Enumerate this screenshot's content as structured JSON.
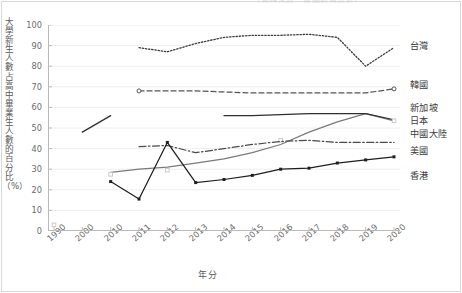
{
  "title_remnant": "（資料來源：各國教育統計）",
  "axes": {
    "ylabel": "大學新生人數占高中畢業生人數的百分比（%）",
    "xlabel": "年分",
    "yticks": [
      "100",
      "90",
      "80",
      "70",
      "60",
      "50",
      "40",
      "30",
      "20",
      "10",
      "0"
    ],
    "xticks": [
      "1990",
      "2000",
      "2010",
      "2011",
      "2012",
      "2013",
      "2014",
      "2015",
      "2016",
      "2017",
      "2018",
      "2019",
      "2020"
    ]
  },
  "legend": [
    {
      "label": "台灣",
      "key": "taiwan"
    },
    {
      "label": "韓國",
      "key": "korea"
    },
    {
      "label": "新加坡",
      "key": "singapore"
    },
    {
      "label": "日本",
      "key": "japan"
    },
    {
      "label": "中國大陸",
      "key": "china"
    },
    {
      "label": "美國",
      "key": "usa"
    },
    {
      "label": "香港",
      "key": "hongkong"
    }
  ],
  "chart_data": {
    "type": "line",
    "title": "",
    "xlabel": "年分",
    "ylabel": "大學新生人數占高中畢業生人數的百分比（%）",
    "categories": [
      "1990",
      "2000",
      "2010",
      "2011",
      "2012",
      "2013",
      "2014",
      "2015",
      "2016",
      "2017",
      "2018",
      "2019",
      "2020"
    ],
    "ylim": [
      0,
      100
    ],
    "ytick_step": 10,
    "grid": "horizontal",
    "legend_position": "right",
    "series": [
      {
        "name": "台灣",
        "color": "#3a3a3a",
        "style": "dotted",
        "marker": "none",
        "values": [
          null,
          null,
          null,
          89,
          87,
          91,
          94,
          95,
          95,
          95.5,
          94,
          80,
          89
        ]
      },
      {
        "name": "韓國",
        "color": "#555555",
        "style": "dashed",
        "marker": "open-circle-ends",
        "values": [
          null,
          null,
          null,
          68,
          68,
          68,
          67.5,
          67,
          67,
          67,
          67,
          67,
          69
        ]
      },
      {
        "name": "新加坡",
        "color": "#7a7a7a",
        "style": "solid",
        "marker": "none",
        "values": [
          null,
          null,
          28.5,
          30,
          31,
          33,
          35,
          38,
          42,
          48,
          53,
          57,
          53.5
        ]
      },
      {
        "name": "日本",
        "color": "#2f2f2f",
        "style": "solid",
        "marker": "none",
        "values": [
          null,
          48,
          56,
          null,
          null,
          null,
          56,
          56,
          56.5,
          57,
          57,
          57,
          54
        ]
      },
      {
        "name": "中國大陸",
        "color": "#c9c9c9",
        "style": "solid",
        "marker": "open-square",
        "values": [
          3,
          null,
          27.5,
          null,
          29.5,
          null,
          null,
          null,
          44,
          null,
          null,
          null,
          53.5
        ]
      },
      {
        "name": "美國",
        "color": "#4a4a4a",
        "style": "dash-dot",
        "marker": "none",
        "values": [
          null,
          null,
          null,
          41,
          41.5,
          38,
          40,
          42,
          43.5,
          44,
          43,
          43,
          43
        ]
      },
      {
        "name": "香港",
        "color": "#1f1f1f",
        "style": "solid",
        "marker": "square",
        "values": [
          null,
          null,
          24,
          15.5,
          43,
          23.5,
          25,
          27,
          30,
          30.5,
          33,
          34.5,
          36
        ]
      }
    ]
  }
}
